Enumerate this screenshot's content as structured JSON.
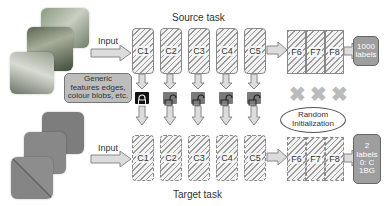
{
  "diagram": {
    "source": {
      "title": "Source task",
      "input_label": "Input",
      "conv_layers": [
        "C1",
        "C2",
        "C3",
        "C4",
        "C5"
      ],
      "fc_layers": [
        "F6",
        "F7",
        "F8"
      ],
      "output_lines": [
        "1000",
        "labels"
      ]
    },
    "target": {
      "title": "Target task",
      "input_label": "Input",
      "conv_layers": [
        "C1",
        "C2",
        "C3",
        "C4",
        "C5"
      ],
      "fc_layers": [
        "F6",
        "F7",
        "F8"
      ],
      "output_lines": [
        "2",
        "labels",
        "0: C",
        "1BG"
      ]
    },
    "annotations": {
      "generic_features": [
        "Generic",
        "features edges,",
        "colour blobs, etc."
      ],
      "random_init": [
        "Random",
        "Initialization"
      ],
      "transfer_locks": [
        "locked",
        "unlocked",
        "unlocked",
        "unlocked",
        "unlocked"
      ],
      "discarded_marks": [
        "x",
        "x",
        "x"
      ]
    },
    "colors": {
      "locked": "#111111",
      "unlocked": "#7a7a7a",
      "arrow_fill": "#dcdcdc",
      "output_fill": "#9e9e9e"
    }
  }
}
